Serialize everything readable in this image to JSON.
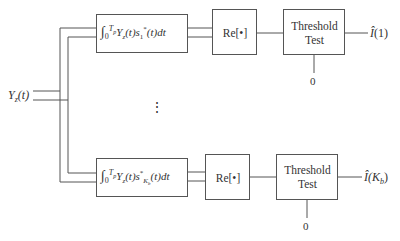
{
  "diagram": {
    "input": {
      "label_main": "Y",
      "label_sub": "z",
      "label_arg": "(t)"
    },
    "branches": [
      {
        "integrator": {
          "upper": "T",
          "upper_sub": "p",
          "lower": "0",
          "body_pre": "Y",
          "body_sub": "z",
          "body_mid": "(t)s",
          "s_sub": "1",
          "s_sup": "*",
          "body_post": "(t)dt"
        },
        "real_part": "Re[•]",
        "threshold": {
          "line1": "Threshold",
          "line2": "Test",
          "ref": "0"
        },
        "output": {
          "hat": "Î",
          "arg": "(1)"
        }
      },
      {
        "integrator": {
          "upper": "T",
          "upper_sub": "p",
          "lower": "0",
          "body_pre": "Y",
          "body_sub": "z",
          "body_mid": "(t)s",
          "s_sup": "*",
          "s_sub": "K",
          "s_sub_sub": "b",
          "body_post": "(t)dt"
        },
        "real_part": "Re[•]",
        "threshold": {
          "line1": "Threshold",
          "line2": "Test",
          "ref": "0"
        },
        "output": {
          "hat": "Î",
          "arg_open": "(K",
          "arg_sub": "b",
          "arg_close": ")"
        }
      }
    ],
    "ellipsis": "⋮"
  }
}
